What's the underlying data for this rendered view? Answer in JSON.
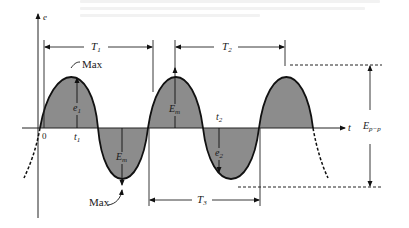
{
  "figure": {
    "type": "sinusoidal waveform diagram",
    "axes": {
      "vertical_label": "e",
      "horizontal_label": "t",
      "origin_label": "0"
    },
    "labels": {
      "max_top": "Max",
      "max_bottom": "Max",
      "t1": "t",
      "t1_sub": "1",
      "t2": "t",
      "t2_sub": "2",
      "e1": "e",
      "e1_sub": "1",
      "e2": "e",
      "e2_sub": "2",
      "em_top": "E",
      "em_top_sub": "m",
      "em_bottom": "E",
      "em_bottom_sub": "m",
      "epp": "E",
      "epp_sub": "p−p"
    },
    "periods": [
      {
        "label": "T",
        "sub": "1",
        "x_start": 44,
        "x_end": 153,
        "y": 47
      },
      {
        "label": "T",
        "sub": "2",
        "x_start": 175,
        "x_end": 285,
        "y": 47
      },
      {
        "label": "T",
        "sub": "3",
        "x_start": 149,
        "x_end": 260,
        "y": 200
      }
    ],
    "colors": {
      "fill": "#8c8c8c",
      "stroke": "#111111",
      "background": "#ffffff"
    }
  }
}
